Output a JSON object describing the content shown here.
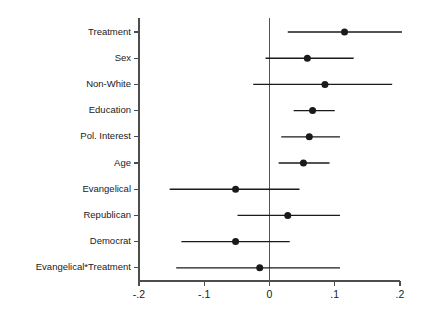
{
  "chart_data": {
    "type": "scatter",
    "title": "",
    "subtitle": "",
    "xlabel": "",
    "ylabel": "",
    "plot_style": "coefficient-plot-with-confidence-intervals",
    "orientation": "horizontal",
    "xlim": [
      -0.2,
      0.2
    ],
    "xticks": [
      -0.2,
      -0.1,
      0,
      0.1,
      0.2
    ],
    "xtick_labels": [
      "-.2",
      "-.1",
      "0",
      ".1",
      ".2"
    ],
    "grid": false,
    "legend": null,
    "reference_line": {
      "value": 0,
      "orientation": "vertical",
      "color": "#555555"
    },
    "marker": {
      "shape": "circle",
      "color": "#1a1a1a",
      "size_px": 7
    },
    "whisker": {
      "color": "#1a1a1a",
      "caps": false
    },
    "categories": [
      "Treatment",
      "Sex",
      "Non-White",
      "Education",
      "Pol. Interest",
      "Age",
      "Evangelical",
      "Republican",
      "Democrat",
      "Evangelical*Treatment"
    ],
    "series": [
      {
        "name": "Coefficient estimate",
        "points": [
          {
            "category": "Treatment",
            "estimate": 0.115,
            "ci_low": 0.028,
            "ci_high": 0.203
          },
          {
            "category": "Sex",
            "estimate": 0.058,
            "ci_low": -0.006,
            "ci_high": 0.129
          },
          {
            "category": "Non-White",
            "estimate": 0.085,
            "ci_low": -0.025,
            "ci_high": 0.188
          },
          {
            "category": "Education",
            "estimate": 0.066,
            "ci_low": 0.037,
            "ci_high": 0.1
          },
          {
            "category": "Pol. Interest",
            "estimate": 0.061,
            "ci_low": 0.018,
            "ci_high": 0.108
          },
          {
            "category": "Age",
            "estimate": 0.052,
            "ci_low": 0.014,
            "ci_high": 0.092
          },
          {
            "category": "Evangelical",
            "estimate": -0.052,
            "ci_low": -0.153,
            "ci_high": 0.046
          },
          {
            "category": "Republican",
            "estimate": 0.028,
            "ci_low": -0.049,
            "ci_high": 0.108
          },
          {
            "category": "Democrat",
            "estimate": -0.052,
            "ci_low": -0.135,
            "ci_high": 0.031
          },
          {
            "category": "Evangelical*Treatment",
            "estimate": -0.015,
            "ci_low": -0.143,
            "ci_high": 0.108
          }
        ]
      }
    ]
  }
}
